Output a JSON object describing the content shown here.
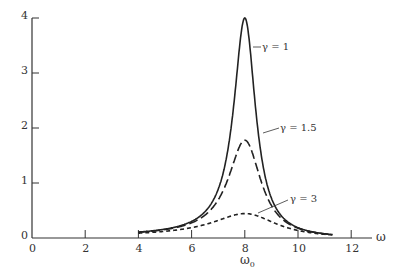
{
  "chart_data": {
    "type": "line",
    "title": "",
    "xlabel": "ω",
    "ylabel": "",
    "xlim": [
      0,
      13
    ],
    "ylim": [
      0,
      4
    ],
    "x_ticks": [
      "0",
      "2",
      "4",
      "6",
      "8",
      "10",
      "12"
    ],
    "y_ticks": [
      "0",
      "1",
      "2",
      "3",
      "4"
    ],
    "x_annotation": "ω0",
    "x_annotation_at": 8,
    "grid": false,
    "legend": "inline labels",
    "series": [
      {
        "name": "γ = 1",
        "style": "solid",
        "peak_x": 8,
        "peak_y": 4.0,
        "x": [
          4,
          5,
          6,
          7,
          7.5,
          8,
          8.5,
          9,
          10,
          11,
          11.3
        ],
        "y": [
          0.07,
          0.13,
          0.25,
          0.7,
          1.6,
          4.0,
          1.6,
          0.7,
          0.25,
          0.13,
          0.1
        ]
      },
      {
        "name": "γ = 1.5",
        "style": "dashed",
        "peak_x": 8,
        "peak_y": 1.78,
        "x": [
          4,
          5,
          6,
          7,
          7.5,
          8,
          8.5,
          9,
          10,
          11,
          11.3
        ],
        "y": [
          0.07,
          0.13,
          0.24,
          0.6,
          1.1,
          1.78,
          1.1,
          0.6,
          0.24,
          0.13,
          0.1
        ]
      },
      {
        "name": "γ = 3",
        "style": "short-dashed",
        "peak_x": 8,
        "peak_y": 0.44,
        "x": [
          4,
          5,
          6,
          7,
          7.5,
          8,
          8.5,
          9,
          10,
          11,
          11.3
        ],
        "y": [
          0.06,
          0.11,
          0.19,
          0.33,
          0.4,
          0.44,
          0.4,
          0.33,
          0.19,
          0.11,
          0.09
        ]
      }
    ]
  },
  "labels": {
    "gamma1": "γ = 1",
    "gamma15": "γ = 1.5",
    "gamma3": "γ = 3",
    "omega": "ω",
    "omega0": "ω",
    "omega0_sub": "0"
  },
  "colors": {
    "ink": "#222222",
    "background": "#ffffff"
  }
}
